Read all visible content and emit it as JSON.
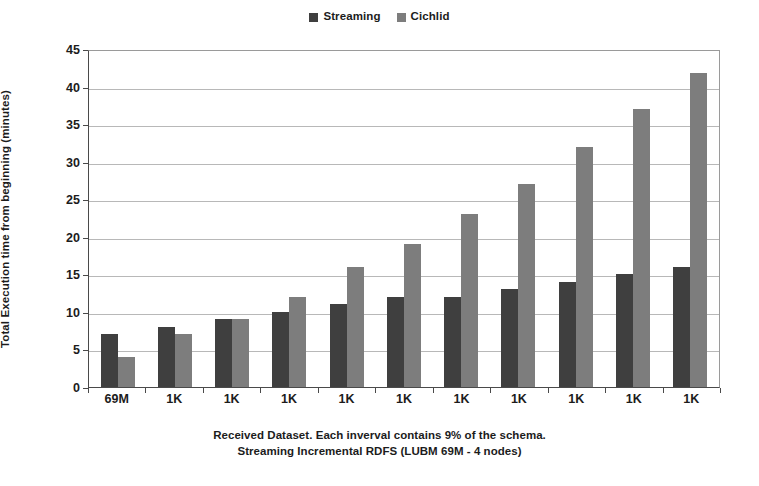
{
  "legend": {
    "position": "top-center",
    "items": [
      {
        "label": "Streaming",
        "color": "#3f3f3f",
        "icon": "square-swatch-icon"
      },
      {
        "label": "Cichlid",
        "color": "#7d7d7d",
        "icon": "square-swatch-icon"
      }
    ]
  },
  "axes": {
    "y_title": "Total Execution time from beginning (minutes)",
    "y_ticks": [
      "0",
      "5",
      "10",
      "15",
      "20",
      "25",
      "30",
      "35",
      "40",
      "45"
    ],
    "x_caption_line1": "Received Dataset. Each inverval contains 9% of the schema.",
    "x_caption_line2": "Streaming Incremental RDFS (LUBM 69M - 4 nodes)"
  },
  "chart_data": {
    "type": "bar",
    "title": "",
    "xlabel": "Received Dataset. Each inverval contains 9% of the schema. Streaming Incremental RDFS (LUBM 69M - 4 nodes)",
    "ylabel": "Total Execution time from beginning (minutes)",
    "ylim": [
      0,
      45
    ],
    "ytick_step": 5,
    "grid": true,
    "legend_position": "top-center",
    "categories": [
      "69M",
      "1K",
      "1K",
      "1K",
      "1K",
      "1K",
      "1K",
      "1K",
      "1K",
      "1K",
      "1K"
    ],
    "series": [
      {
        "name": "Streaming",
        "color": "#3f3f3f",
        "values": [
          7,
          8,
          9,
          10,
          11,
          12,
          12,
          13,
          14,
          15,
          16
        ]
      },
      {
        "name": "Cichlid",
        "color": "#7d7d7d",
        "values": [
          4,
          7,
          9,
          12,
          16,
          19,
          23,
          27,
          32,
          37,
          41.8
        ]
      }
    ]
  }
}
